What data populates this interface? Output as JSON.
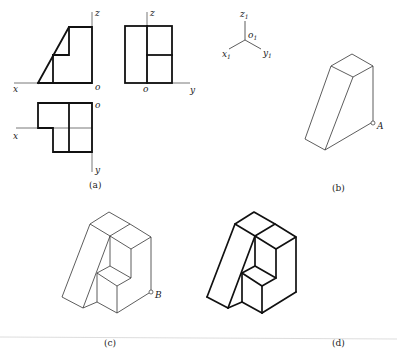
{
  "figure": {
    "panels": [
      {
        "id": "a",
        "caption": "(a)",
        "description": "Three orthographic views (front, side, top)"
      },
      {
        "id": "b",
        "caption": "(b)",
        "description": "Isometric of wedge block with point A"
      },
      {
        "id": "c",
        "caption": "(c)",
        "description": "Isometric with cut-out, thin lines, point B"
      },
      {
        "id": "d",
        "caption": "(d)",
        "description": "Final isometric with thick outlines"
      }
    ],
    "axis_labels": {
      "front_z": "z",
      "front_x": "x",
      "front_o": "o",
      "side_z": "z",
      "side_o": "o",
      "side_y": "y",
      "top_o": "o",
      "top_x": "x",
      "top_y": "y",
      "iso_z": "z",
      "iso_o": "o",
      "iso_x": "x",
      "iso_y": "y",
      "iso_sub": "1"
    },
    "points": {
      "A": "A",
      "B": "B"
    }
  }
}
